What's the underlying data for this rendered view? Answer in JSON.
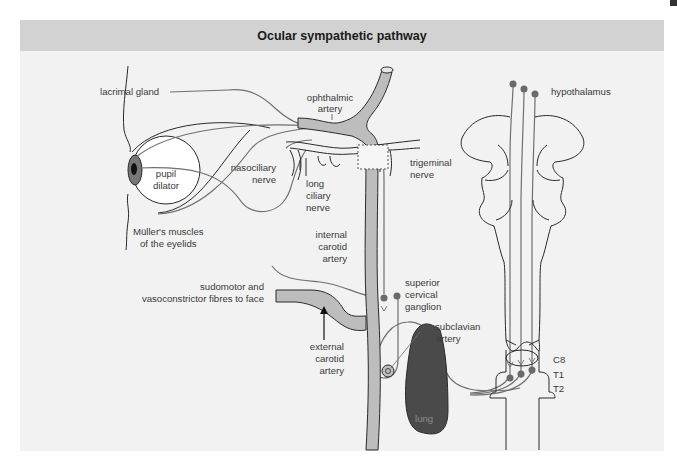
{
  "title": "Ocular sympathetic pathway",
  "colors": {
    "panel_bg": "#f2f2f2",
    "title_bar_bg": "#d2d2d2",
    "artery_fill": "#bdbdbd",
    "nerve_stroke": "#6f6f6f",
    "ganglion_dot": "#6a6a6a",
    "lung_fill": "#4a4a4a",
    "outline": "#2a2a2a",
    "iris": "#777777"
  },
  "labels": {
    "lacrimal_gland": "lacrimal gland",
    "ophthalmic_artery": [
      "ophthalmic",
      "artery"
    ],
    "hypothalamus": "hypothalamus",
    "nasociliary_nerve": [
      "nasociliary",
      "nerve"
    ],
    "pupil_dilator": [
      "pupil",
      "dilator"
    ],
    "long_ciliary_nerve": [
      "long",
      "ciliary",
      "nerve"
    ],
    "trigeminal_nerve": [
      "trigeminal",
      "nerve"
    ],
    "muller_muscles": [
      "Müller's muscles",
      "of the eyelids"
    ],
    "internal_carotid_artery": [
      "internal",
      "carotid",
      "artery"
    ],
    "sudomotor_fibres": [
      "sudomotor and",
      "vasoconstrictor fibres to face"
    ],
    "superior_cervical_ganglion": [
      "superior",
      "cervical",
      "ganglion"
    ],
    "subclavian_artery": [
      "subclavian",
      "artery"
    ],
    "external_carotid_artery": [
      "external",
      "carotid",
      "artery"
    ],
    "lung": "lung",
    "spinal_levels": [
      "C8",
      "T1",
      "T2"
    ]
  }
}
